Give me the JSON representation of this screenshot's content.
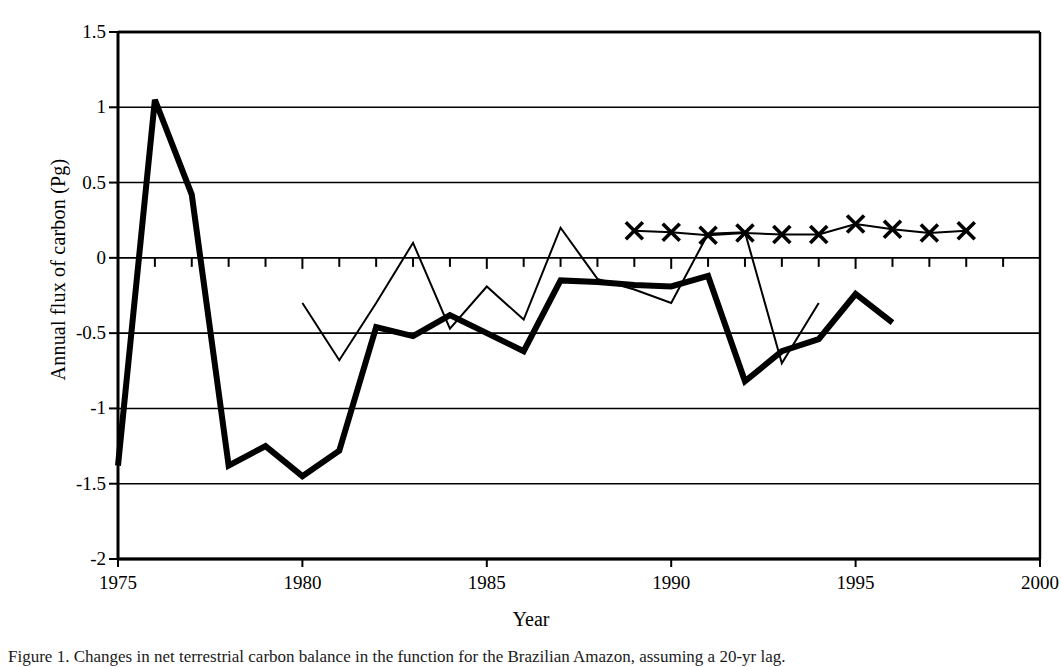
{
  "figure": {
    "caption": "Figure 1.  Changes in net terrestrial carbon balance in the function for the Brazilian Amazon, assuming a 20-yr lag."
  },
  "axes": {
    "y_title": "Annual flux of carbon (Pg)",
    "x_title": "Year",
    "y_ticks": [
      "1.5",
      "1",
      "0.5",
      "0",
      "-0.5",
      "-1",
      "-1.5",
      "-2"
    ],
    "x_ticks": [
      "1975",
      "1980",
      "1985",
      "1990",
      "1995",
      "2000"
    ]
  },
  "colors": {
    "line": "#000000",
    "background": "#ffffff",
    "grid": "#000000"
  },
  "chart_data": {
    "type": "line",
    "title": "",
    "xlabel": "Year",
    "ylabel": "Annual flux of carbon (Pg)",
    "xlim": [
      1975,
      2000
    ],
    "ylim": [
      -2,
      1.5
    ],
    "xticks": [
      1975,
      1980,
      1985,
      1990,
      1995,
      2000
    ],
    "yticks": [
      -2,
      -1.5,
      -1,
      -0.5,
      0,
      0.5,
      1,
      1.5
    ],
    "grid": "horizontal",
    "legend": "none",
    "series": [
      {
        "name": "thick-line",
        "style": "thick solid line, no markers",
        "linewidth": 6,
        "marker": "none",
        "x": [
          1975,
          1976,
          1977,
          1978,
          1979,
          1980,
          1981,
          1982,
          1983,
          1984,
          1985,
          1986,
          1987,
          1988,
          1989,
          1990,
          1991,
          1992,
          1993,
          1994,
          1995,
          1996
        ],
        "y": [
          -1.38,
          1.05,
          0.42,
          -1.38,
          -1.25,
          -1.45,
          -1.28,
          -0.46,
          -0.52,
          -0.38,
          -0.5,
          -0.62,
          -0.15,
          -0.16,
          -0.18,
          -0.19,
          -0.12,
          -0.82,
          -0.62,
          -0.54,
          -0.24,
          -0.43
        ]
      },
      {
        "name": "thin-line",
        "style": "thin solid line, no markers",
        "linewidth": 2,
        "marker": "none",
        "x": [
          1980,
          1981,
          1982,
          1983,
          1984,
          1985,
          1986,
          1987,
          1988,
          1989,
          1990,
          1991,
          1992,
          1993,
          1994
        ],
        "y": [
          -0.3,
          -0.68,
          -0.3,
          0.1,
          -0.47,
          -0.19,
          -0.41,
          0.2,
          -0.14,
          -0.21,
          -0.3,
          0.16,
          0.17,
          -0.7,
          -0.3
        ]
      },
      {
        "name": "cross-marker-line",
        "style": "thin line with x markers",
        "linewidth": 2,
        "marker": "x",
        "x": [
          1989,
          1990,
          1991,
          1992,
          1993,
          1994,
          1995,
          1996,
          1997,
          1998
        ],
        "y": [
          0.18,
          0.17,
          0.15,
          0.165,
          0.155,
          0.155,
          0.225,
          0.19,
          0.165,
          0.18
        ]
      }
    ]
  }
}
